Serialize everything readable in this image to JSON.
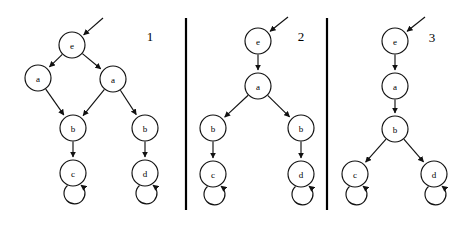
{
  "figure": {
    "type": "directed-graph-triptych",
    "background_color": "#ffffff",
    "stroke_color": "#111111",
    "panel_count": 3,
    "node_radius": 13,
    "panels": [
      {
        "number_label": "1",
        "number_x": 150,
        "number_y": 36,
        "nodes": [
          {
            "id": "p1-e",
            "label": "e",
            "cx": 72,
            "cy": 45
          },
          {
            "id": "p1-a1",
            "label": "a",
            "cx": 38,
            "cy": 78
          },
          {
            "id": "p1-a2",
            "label": "a",
            "cx": 113,
            "cy": 79
          },
          {
            "id": "p1-b1",
            "label": "b",
            "cx": 73,
            "cy": 128
          },
          {
            "id": "p1-b2",
            "label": "b",
            "cx": 145,
            "cy": 128
          },
          {
            "id": "p1-c",
            "label": "c",
            "cx": 73,
            "cy": 173
          },
          {
            "id": "p1-d",
            "label": "d",
            "cx": 145,
            "cy": 173
          }
        ],
        "edges": [
          {
            "from": "p1-e",
            "to": "p1-a1"
          },
          {
            "from": "p1-e",
            "to": "p1-a2"
          },
          {
            "from": "p1-a1",
            "to": "p1-b1"
          },
          {
            "from": "p1-a2",
            "to": "p1-b1"
          },
          {
            "from": "p1-a2",
            "to": "p1-b2"
          },
          {
            "from": "p1-b1",
            "to": "p1-c"
          },
          {
            "from": "p1-b2",
            "to": "p1-d"
          }
        ],
        "self_loops": [
          {
            "node": "p1-c",
            "direction": "down"
          },
          {
            "node": "p1-d",
            "direction": "down"
          }
        ],
        "entry_arrow": {
          "node": "p1-e",
          "from_x": 103,
          "from_y": 18
        }
      },
      {
        "number_label": "2",
        "number_x": 301,
        "number_y": 36,
        "nodes": [
          {
            "id": "p2-e",
            "label": "e",
            "cx": 258,
            "cy": 41
          },
          {
            "id": "p2-a",
            "label": "a",
            "cx": 258,
            "cy": 86
          },
          {
            "id": "p2-b1",
            "label": "b",
            "cx": 213,
            "cy": 128
          },
          {
            "id": "p2-b2",
            "label": "b",
            "cx": 301,
            "cy": 128
          },
          {
            "id": "p2-c",
            "label": "c",
            "cx": 213,
            "cy": 174
          },
          {
            "id": "p2-d",
            "label": "d",
            "cx": 301,
            "cy": 174
          }
        ],
        "edges": [
          {
            "from": "p2-e",
            "to": "p2-a"
          },
          {
            "from": "p2-a",
            "to": "p2-b1"
          },
          {
            "from": "p2-a",
            "to": "p2-b2"
          },
          {
            "from": "p2-b1",
            "to": "p2-c"
          },
          {
            "from": "p2-b2",
            "to": "p2-d"
          }
        ],
        "self_loops": [
          {
            "node": "p2-c",
            "direction": "down"
          },
          {
            "node": "p2-d",
            "direction": "down"
          }
        ],
        "entry_arrow": {
          "node": "p2-e",
          "from_x": 288,
          "from_y": 17
        }
      },
      {
        "number_label": "3",
        "number_x": 432,
        "number_y": 37,
        "nodes": [
          {
            "id": "p3-e",
            "label": "e",
            "cx": 395,
            "cy": 41
          },
          {
            "id": "p3-a",
            "label": "a",
            "cx": 395,
            "cy": 86
          },
          {
            "id": "p3-b",
            "label": "b",
            "cx": 395,
            "cy": 129
          },
          {
            "id": "p3-c",
            "label": "c",
            "cx": 355,
            "cy": 174
          },
          {
            "id": "p3-d",
            "label": "d",
            "cx": 434,
            "cy": 174
          }
        ],
        "edges": [
          {
            "from": "p3-e",
            "to": "p3-a"
          },
          {
            "from": "p3-a",
            "to": "p3-b"
          },
          {
            "from": "p3-b",
            "to": "p3-c"
          },
          {
            "from": "p3-b",
            "to": "p3-d"
          }
        ],
        "self_loops": [
          {
            "node": "p3-c",
            "direction": "down"
          },
          {
            "node": "p3-d",
            "direction": "down"
          }
        ],
        "entry_arrow": {
          "node": "p3-e",
          "from_x": 425,
          "from_y": 17
        }
      }
    ],
    "dividers": [
      {
        "x": 186,
        "y1": 18,
        "y2": 210
      },
      {
        "x": 327,
        "y1": 18,
        "y2": 210
      }
    ]
  }
}
